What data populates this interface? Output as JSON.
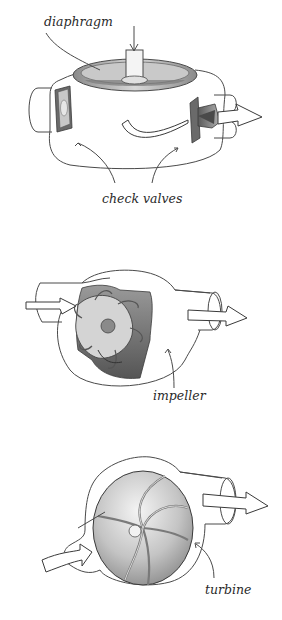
{
  "figure": {
    "panels": [
      {
        "id": "diaphragm-pump",
        "labels": {
          "diaphragm": "diaphragm",
          "check_valves": "check valves"
        }
      },
      {
        "id": "impeller-pump",
        "labels": {
          "impeller": "impeller"
        }
      },
      {
        "id": "turbine-pump",
        "labels": {
          "turbine": "turbine"
        }
      }
    ]
  },
  "colors": {
    "background": "#ffffff",
    "line": "#4a4a4a",
    "shade_dark": "#6e6e6e",
    "shade_mid": "#a8a8a8",
    "shade_light": "#dcdcdc"
  }
}
